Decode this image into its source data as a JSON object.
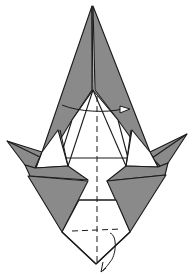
{
  "diagram": {
    "kind": "origami-folding-step",
    "description": "Folded origami base with two gray upper flaps meeting at a top point, two side wing points, two gray lower triangular flaps, and a white bottom diamond section with dashed valley-fold lines and curved fold arrows.",
    "colors": {
      "paper_colored": "#8a8a8a",
      "paper_white": "#ffffff",
      "line": "#1a1a1a",
      "background": "#ffffff"
    },
    "symbols": {
      "fold_arrow_top": "curved arrow sweeping left-to-right across the upper center",
      "fold_arrow_bottom": "small curved arrow looping at the bottom point",
      "valley_fold_vertical": "dashed vertical centerline",
      "valley_fold_horizontal": "dashed horizontal line near bottom"
    }
  }
}
